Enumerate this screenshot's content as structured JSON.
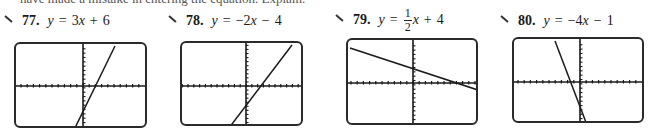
{
  "clipped_text": "have made a mistake in entering the equation. Explain.",
  "problems": [
    {
      "number": "77.",
      "equation": {
        "lhs": "y",
        "eq": "=",
        "parts": [
          "3",
          "x",
          "+",
          "6"
        ]
      },
      "equation_text": "y = 3x + 6",
      "icon": "pencil-icon",
      "screen": {
        "box": {
          "left": 14,
          "top": 42,
          "width": 133,
          "height": 86
        },
        "x_axis_y": 42,
        "y_axis_x": 67,
        "tick_spacing": 6.2,
        "line": {
          "x1": 99,
          "y1": 2,
          "x2": 58,
          "y2": 86
        }
      }
    },
    {
      "number": "78.",
      "equation": {
        "lhs": "y",
        "eq": "=",
        "parts": [
          "−2",
          "x",
          "−",
          "4"
        ]
      },
      "equation_text": "y = −2x − 4",
      "icon": "pencil-icon",
      "screen": {
        "box": {
          "left": 180,
          "top": 41,
          "width": 123,
          "height": 85
        },
        "x_axis_y": 43,
        "y_axis_x": 64,
        "tick_spacing": 5.8,
        "line": {
          "x1": 110,
          "y1": 2,
          "x2": 47,
          "y2": 85
        }
      }
    },
    {
      "number": "79.",
      "equation": {
        "lhs": "y",
        "eq": "=",
        "frac": {
          "num": "1",
          "den": "2"
        },
        "parts": [
          "x",
          "+",
          "4"
        ]
      },
      "equation_text": "y = 1/2x + 4",
      "icon": "pencil-icon",
      "screen": {
        "box": {
          "left": 346,
          "top": 38,
          "width": 132,
          "height": 87
        },
        "x_axis_y": 43,
        "y_axis_x": 65,
        "tick_spacing": 6.2,
        "line": {
          "x1": 2,
          "y1": 8,
          "x2": 130,
          "y2": 50
        }
      }
    },
    {
      "number": "80.",
      "equation": {
        "lhs": "y",
        "eq": "=",
        "parts": [
          "−4",
          "x",
          "−",
          "1"
        ]
      },
      "equation_text": "y = −4x − 1",
      "icon": "pencil-icon",
      "screen": {
        "box": {
          "left": 512,
          "top": 37,
          "width": 132,
          "height": 86
        },
        "x_axis_y": 43,
        "y_axis_x": 66,
        "tick_spacing": 6.2,
        "line": {
          "x1": 41,
          "y1": 2,
          "x2": 73,
          "y2": 86
        }
      }
    }
  ],
  "colors": {
    "ink": "#1a1a1a",
    "frame": "#2a2a2a",
    "background": "#ffffff"
  }
}
